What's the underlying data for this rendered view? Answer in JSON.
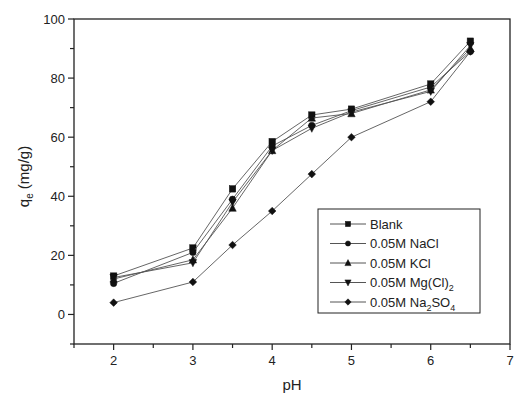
{
  "chart_data": {
    "type": "line",
    "title": "",
    "xlabel": "pH",
    "ylabel": "q_e (mg/g)",
    "ylabel_main": "q",
    "ylabel_sub": "e",
    "ylabel_unit": " (mg/g)",
    "xlim": [
      1.5,
      7
    ],
    "ylim": [
      -10,
      100
    ],
    "xticks": [
      2,
      3,
      4,
      5,
      6,
      7
    ],
    "yticks": [
      0,
      20,
      40,
      60,
      80,
      100
    ],
    "grid": false,
    "legend_position": "lower right (inside)",
    "x": [
      2,
      3,
      3.5,
      4,
      4.5,
      5,
      6,
      6.5
    ],
    "series": [
      {
        "name": "Blank",
        "label_main": "Blank",
        "label_sub": "",
        "label_tail": "",
        "marker": "square",
        "values": [
          13,
          22.5,
          42.5,
          58.5,
          67.5,
          69.5,
          78,
          92.5
        ]
      },
      {
        "name": "0.05M NaCl",
        "label_main": "0.05M  NaCl",
        "label_sub": "",
        "label_tail": "",
        "marker": "circle",
        "values": [
          10.5,
          21,
          39,
          57,
          64,
          69,
          77,
          89
        ]
      },
      {
        "name": "0.05M KCl",
        "label_main": "0.05M  KCl",
        "label_sub": "",
        "label_tail": "",
        "marker": "triangle-up",
        "values": [
          12,
          18.5,
          36,
          55.5,
          66.5,
          68,
          76,
          90
        ]
      },
      {
        "name": "0.05M Mg(Cl)2",
        "label_main": "0.05M  Mg(Cl)",
        "label_sub": "2",
        "label_tail": "",
        "marker": "triangle-down",
        "values": [
          12.5,
          17.5,
          38,
          55.5,
          63,
          68.5,
          75.5,
          91
        ]
      },
      {
        "name": "0.05M Na2SO4",
        "label_main": "0.05M  Na",
        "label_sub": "2",
        "label_tail": "SO",
        "label_sub2": "4",
        "marker": "diamond",
        "values": [
          4,
          11,
          23.5,
          35,
          47.5,
          60,
          72,
          89
        ]
      }
    ]
  },
  "colors": {
    "line": "#555555",
    "marker": "#111111",
    "axis": "#222222",
    "background": "#ffffff"
  },
  "layout": {
    "plot_left": 74,
    "plot_right": 510,
    "plot_top": 19,
    "plot_bottom": 344,
    "legend": {
      "x": 318,
      "y": 209,
      "w": 162,
      "h": 104
    }
  }
}
